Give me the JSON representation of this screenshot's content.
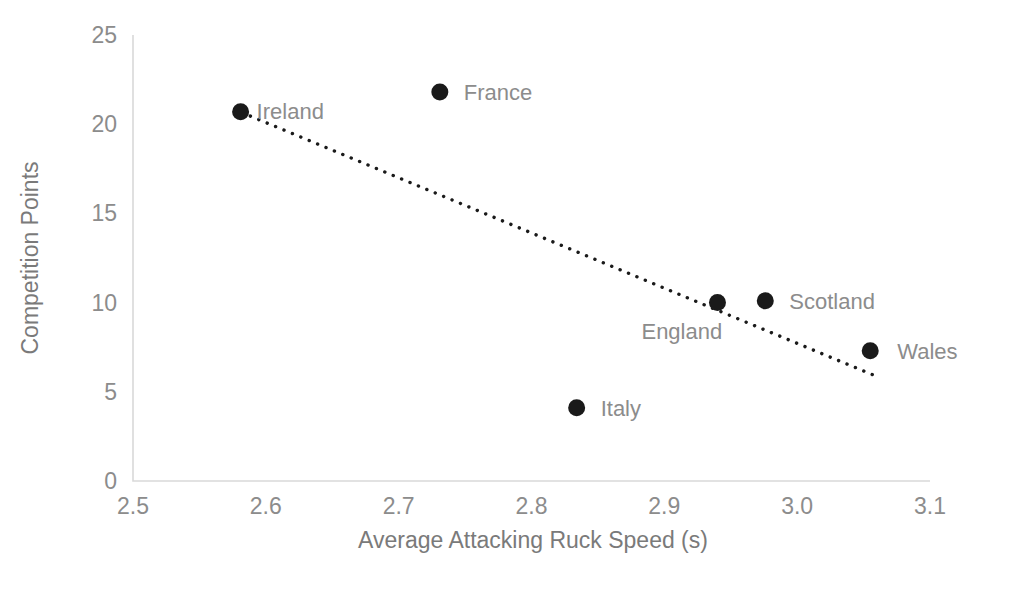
{
  "chart_data": {
    "type": "scatter",
    "title": "",
    "xlabel": "Average Attacking Ruck Speed (s)",
    "ylabel": "Competition Points",
    "xlim": [
      2.5,
      3.1
    ],
    "ylim": [
      0,
      25
    ],
    "xticks": [
      "2.5",
      "2.6",
      "2.7",
      "2.8",
      "2.9",
      "3.0",
      "3.1"
    ],
    "xtick_values": [
      2.5,
      2.6,
      2.7,
      2.8,
      2.9,
      3.0,
      3.1
    ],
    "yticks": [
      "0",
      "5",
      "10",
      "15",
      "20",
      "25"
    ],
    "ytick_values": [
      0,
      5,
      10,
      15,
      20,
      25
    ],
    "grid": false,
    "legend": "none",
    "marker_color": "#1a1a1a",
    "text_color": "#8c8c8c",
    "axis_color": "#d9d9d9",
    "points": [
      {
        "label": "Ireland",
        "x": 2.581,
        "y": 20.7,
        "label_dx": 16,
        "label_dy": 7
      },
      {
        "label": "France",
        "x": 2.731,
        "y": 21.8,
        "label_dx": 24,
        "label_dy": 8
      },
      {
        "label": "Italy",
        "x": 2.834,
        "y": 4.1,
        "label_dx": 24,
        "label_dy": 8
      },
      {
        "label": "England",
        "x": 2.94,
        "y": 10.0,
        "label_dx": -76,
        "label_dy": 36
      },
      {
        "label": "Scotland",
        "x": 2.976,
        "y": 10.1,
        "label_dx": 24,
        "label_dy": 8
      },
      {
        "label": "Wales",
        "x": 3.055,
        "y": 7.3,
        "label_dx": 27,
        "label_dy": 8
      }
    ],
    "trendline": {
      "type": "linear",
      "x_start": 2.582,
      "y_start": 20.65,
      "x_end": 3.057,
      "y_end": 5.95,
      "style": "dotted"
    }
  }
}
